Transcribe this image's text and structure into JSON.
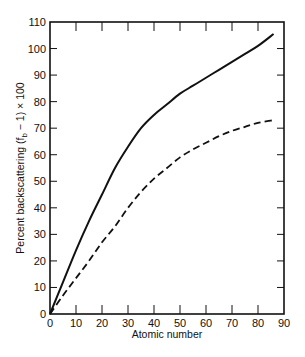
{
  "chart_data": {
    "type": "line",
    "title": "",
    "xlabel": "Atomic number",
    "ylabel": "Percent backscattering (f_b − 1) × 100",
    "ylabel_parts": {
      "pre": "Percent backscattering (f",
      "sub": "b",
      "post": " − 1) × 100"
    },
    "xlim": [
      0,
      90
    ],
    "ylim": [
      0,
      110
    ],
    "x_ticks": [
      0,
      10,
      20,
      30,
      40,
      50,
      60,
      70,
      80,
      90
    ],
    "y_ticks": [
      0,
      10,
      20,
      30,
      40,
      50,
      60,
      70,
      80,
      90,
      100,
      110
    ],
    "grid": false,
    "legend": null,
    "series": [
      {
        "name": "solid",
        "style": "solid",
        "x": [
          0,
          5,
          10,
          15,
          20,
          25,
          30,
          35,
          40,
          45,
          50,
          55,
          60,
          65,
          70,
          75,
          80,
          86
        ],
        "values": [
          0,
          12,
          24,
          35,
          45,
          55,
          63,
          70,
          75,
          79,
          83,
          86,
          89,
          92,
          95,
          98,
          101,
          105.5
        ]
      },
      {
        "name": "dashed",
        "style": "dashed",
        "x": [
          0,
          5,
          10,
          15,
          20,
          25,
          30,
          35,
          40,
          45,
          50,
          55,
          60,
          65,
          70,
          75,
          80,
          86
        ],
        "values": [
          0,
          7,
          13.5,
          20,
          27,
          33,
          40,
          46,
          51,
          55,
          59,
          62,
          64.5,
          67,
          69,
          70.5,
          72,
          73
        ]
      }
    ]
  },
  "colors": {
    "line": "#111111",
    "axis": "#111111",
    "background": "#ffffff"
  }
}
